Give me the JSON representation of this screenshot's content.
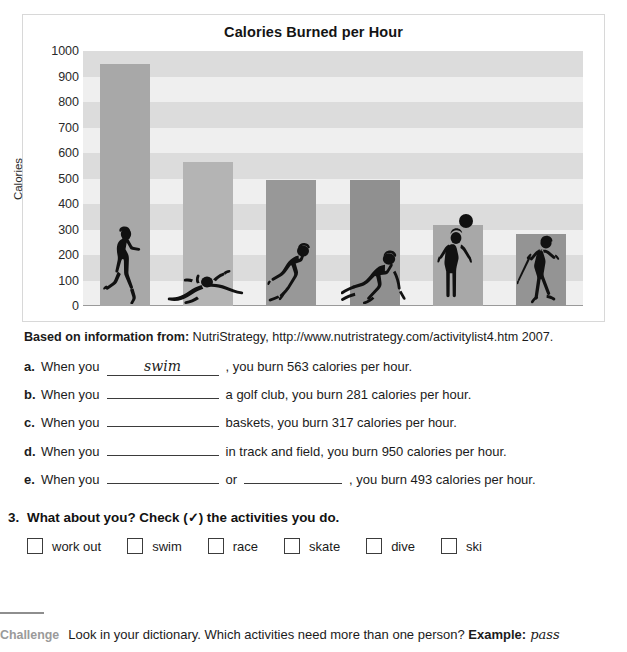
{
  "chart_data": {
    "type": "bar",
    "title": "Calories Burned per Hour",
    "xlabel": "",
    "ylabel": "Calories",
    "ylim": [
      0,
      1000
    ],
    "ytick_step": 100,
    "yticks": [
      "1000",
      "900",
      "800",
      "700",
      "600",
      "500",
      "400",
      "300",
      "200",
      "100",
      "0"
    ],
    "grid": "horizontal-bands",
    "legend": "none",
    "categories": [
      "run",
      "swim",
      "skate",
      "ski",
      "shoot baskets",
      "swing a golf club"
    ],
    "values": [
      950,
      563,
      493,
      493,
      317,
      281
    ],
    "icons": [
      "runner-icon",
      "swimmer-icon",
      "skater-icon",
      "skier-icon",
      "basketball-player-icon",
      "golfer-icon"
    ],
    "bar_colors": [
      "#a8a8a8",
      "#b4b4b4",
      "#989898",
      "#909090",
      "#a8a8a8",
      "#949494"
    ]
  },
  "chart": {
    "title": "Calories Burned per Hour",
    "y_axis_label": "Calories"
  },
  "source": {
    "lead": "Based on information from:",
    "text": " NutriStrategy, http://www.nutristrategy.com/activitylist4.htm 2007."
  },
  "exercise": {
    "items": [
      {
        "letter": "a.",
        "pre": "When you",
        "answer": "swim",
        "mid": ", you burn 563 calories per hour.",
        "answer2": "",
        "mid2": ""
      },
      {
        "letter": "b.",
        "pre": "When you",
        "answer": "",
        "mid": "a golf club, you burn 281 calories per hour.",
        "answer2": "",
        "mid2": ""
      },
      {
        "letter": "c.",
        "pre": "When you",
        "answer": "",
        "mid": "baskets, you burn 317 calories per hour.",
        "answer2": "",
        "mid2": ""
      },
      {
        "letter": "d.",
        "pre": "When you",
        "answer": "",
        "mid": "in track and field, you burn 950 calories per hour.",
        "answer2": "",
        "mid2": ""
      },
      {
        "letter": "e.",
        "pre": "When you",
        "answer": "",
        "mid": "or",
        "answer2": "",
        "mid2": ", you burn 493 calories per hour."
      }
    ]
  },
  "section3": {
    "number": "3.",
    "heading": "What about you? Check (✓) the activities you do.",
    "options": [
      "work out",
      "swim",
      "race",
      "skate",
      "dive",
      "ski"
    ]
  },
  "challenge": {
    "tag": "Challenge",
    "text_before": "Look in your dictionary. Which activities need more than one person? ",
    "bold": "Example:",
    "italic": " pass"
  }
}
